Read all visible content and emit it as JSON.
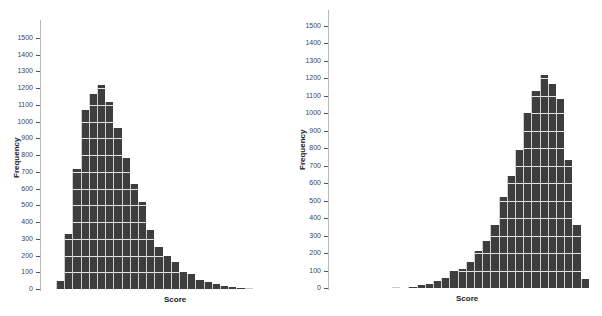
{
  "chart_data": [
    {
      "type": "bar",
      "title": "",
      "xlabel": "Score",
      "ylabel": "Frequency",
      "ylim": [
        0,
        1550
      ],
      "yticks": [
        0,
        100,
        200,
        300,
        400,
        500,
        600,
        700,
        800,
        900,
        1000,
        1100,
        1200,
        1300,
        1400,
        1500
      ],
      "grid": false,
      "description": "Right-skewed histogram",
      "bin_index": [
        1,
        2,
        3,
        4,
        5,
        6,
        7,
        8,
        9,
        10,
        11,
        12,
        13,
        14,
        15,
        16,
        17,
        18,
        19,
        20,
        21,
        22,
        23,
        24
      ],
      "values": [
        45,
        330,
        720,
        1070,
        1165,
        1220,
        1120,
        960,
        780,
        630,
        520,
        350,
        250,
        200,
        160,
        100,
        90,
        55,
        40,
        28,
        18,
        12,
        5,
        3
      ]
    },
    {
      "type": "bar",
      "title": "",
      "xlabel": "Score",
      "ylabel": "Frequency",
      "ylim": [
        0,
        1550
      ],
      "yticks": [
        0,
        100,
        200,
        300,
        400,
        500,
        600,
        700,
        800,
        900,
        1000,
        1100,
        1200,
        1300,
        1400,
        1500
      ],
      "grid": false,
      "description": "Left-skewed histogram",
      "bin_index": [
        1,
        2,
        3,
        4,
        5,
        6,
        7,
        8,
        9,
        10,
        11,
        12,
        13,
        14,
        15,
        16,
        17,
        18,
        19,
        20,
        21,
        22,
        23,
        24,
        25
      ],
      "values": [
        3,
        0,
        8,
        15,
        25,
        40,
        55,
        95,
        110,
        150,
        210,
        270,
        360,
        520,
        640,
        790,
        1000,
        1130,
        1220,
        1170,
        1080,
        730,
        360,
        50,
        0
      ]
    }
  ],
  "left": {
    "ylabel": "Frequency",
    "xlabel": "Score",
    "tick_labels": [
      "0",
      "100",
      "200",
      "300",
      "400",
      "500",
      "600",
      "700",
      "800",
      "900",
      "1000",
      "1100",
      "1200",
      "1300",
      "1400",
      "1500"
    ]
  },
  "right": {
    "ylabel": "Frequency",
    "xlabel": "Score",
    "tick_labels": [
      "0",
      "100",
      "200",
      "300",
      "400",
      "500",
      "600",
      "700",
      "800",
      "900",
      "1000",
      "1100",
      "1200",
      "1300",
      "1400",
      "1500"
    ]
  }
}
